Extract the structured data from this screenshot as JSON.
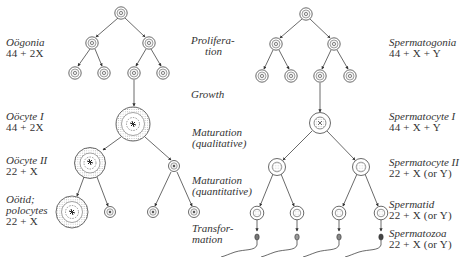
{
  "female": {
    "labels": [
      {
        "name": "Oögonia",
        "formula": "44 + 2X"
      },
      {
        "name": "Oöcyte I",
        "formula": "44 + 2X"
      },
      {
        "name": "Oöcyte II",
        "formula": "22 + X"
      },
      {
        "name": "Oötid;",
        "name2": "polocytes",
        "formula": "22 + X"
      }
    ]
  },
  "stages": [
    {
      "line1": "Prolifera-",
      "line2": "tion"
    },
    {
      "line1": "Growth",
      "line2": ""
    },
    {
      "line1": "Maturation",
      "line2": "(qualitative)"
    },
    {
      "line1": "Maturation",
      "line2": "(quantitative)"
    },
    {
      "line1": "Transfor-",
      "line2": "mation"
    }
  ],
  "male": {
    "labels": [
      {
        "name": "Spermatogonia",
        "formula": "44 + X + Y"
      },
      {
        "name": "Spermatocyte I",
        "formula": "44 + X + Y"
      },
      {
        "name": "Spermatocyte II",
        "formula": "22 + X (or Y)"
      },
      {
        "name": "Spermatid",
        "formula": "22 + X (or Y)"
      },
      {
        "name": "Spermatozoa",
        "formula": "22 + X (or Y)"
      }
    ]
  },
  "colors": {
    "ink": "#333333",
    "stipple": "#9a9a9a",
    "background": "#ffffff"
  }
}
